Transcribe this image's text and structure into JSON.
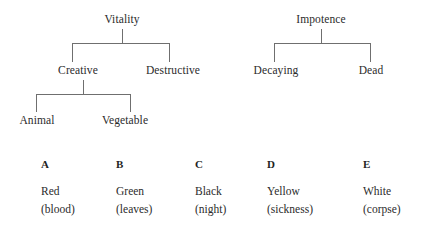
{
  "figure": {
    "trees": [
      {
        "id": "vitality-tree",
        "root": "Vitality",
        "level2": [
          "Creative",
          "Destructive"
        ],
        "level3": [
          "Animal",
          "Vegetable"
        ]
      },
      {
        "id": "impotence-tree",
        "root": "Impotence",
        "level2": [
          "Decaying",
          "Dead"
        ],
        "level3": []
      }
    ],
    "legend": {
      "letters": [
        "A",
        "B",
        "C",
        "D",
        "E"
      ],
      "colors": [
        "Red",
        "Green",
        "Black",
        "Yellow",
        "White"
      ],
      "glosses": [
        "(blood)",
        "(leaves)",
        "(night)",
        "(sickness)",
        "(corpse)"
      ]
    },
    "style": {
      "background": "#ffffff",
      "text_color": "#2b2b2b",
      "line_color": "#6f6f6f"
    }
  }
}
